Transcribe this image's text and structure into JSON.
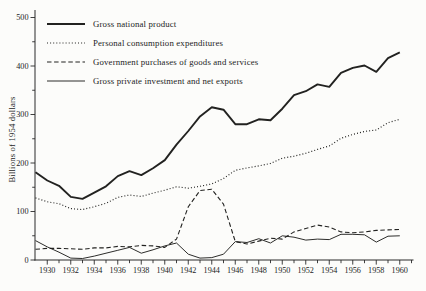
{
  "figure": {
    "background": "#fcfcfa",
    "ink": "#222220"
  },
  "chart_data": {
    "type": "line",
    "title": "",
    "xlabel": "",
    "ylabel": "Billions of 1954 dollars",
    "x": [
      1929,
      1930,
      1931,
      1932,
      1933,
      1934,
      1935,
      1936,
      1937,
      1938,
      1939,
      1940,
      1941,
      1942,
      1943,
      1944,
      1945,
      1946,
      1947,
      1948,
      1949,
      1950,
      1951,
      1952,
      1953,
      1954,
      1955,
      1956,
      1957,
      1958,
      1959,
      1960
    ],
    "x_tick_labels": [
      "1930",
      "1932",
      "1934",
      "1936",
      "1938",
      "1940",
      "1942",
      "1944",
      "1946",
      "1948",
      "1950",
      "1952",
      "1954",
      "1956",
      "1958",
      "1960"
    ],
    "x_major_ticks": [
      1930,
      1932,
      1934,
      1936,
      1938,
      1940,
      1942,
      1944,
      1946,
      1948,
      1950,
      1952,
      1954,
      1956,
      1958,
      1960
    ],
    "x_minor_ticks": [
      1931,
      1933,
      1935,
      1937,
      1939,
      1941,
      1943,
      1945,
      1947,
      1949,
      1951,
      1953,
      1955,
      1957,
      1959,
      1961
    ],
    "ylim": [
      0,
      500
    ],
    "y_major_ticks": [
      0,
      100,
      200,
      300,
      400,
      500
    ],
    "y_major_tick_labels": [
      "0",
      "100",
      "200",
      "300",
      "400",
      "500"
    ],
    "y_minor_ticks": [
      50,
      150,
      250,
      350,
      450
    ],
    "grid": false,
    "legend_position": "upper-left-inside",
    "series": [
      {
        "name": "Gross national product",
        "line": "solid-thick",
        "values": [
          181,
          164,
          153,
          130,
          126,
          139,
          152,
          173,
          183,
          175,
          189,
          206,
          238,
          266,
          296,
          315,
          310,
          280,
          280,
          290,
          288,
          312,
          340,
          348,
          362,
          357,
          386,
          396,
          401,
          388,
          416,
          428
        ]
      },
      {
        "name": "Personal consumption expenditures",
        "line": "dotted",
        "values": [
          128,
          120,
          116,
          106,
          104,
          110,
          117,
          129,
          134,
          131,
          138,
          144,
          151,
          148,
          152,
          157,
          168,
          185,
          190,
          194,
          199,
          210,
          214,
          220,
          228,
          235,
          251,
          259,
          265,
          268,
          283,
          290
        ]
      },
      {
        "name": "Government purchases of goods and services",
        "line": "dashed",
        "values": [
          22,
          24,
          24,
          23,
          22,
          25,
          25,
          28,
          27,
          30,
          29,
          26,
          43,
          110,
          143,
          146,
          115,
          38,
          33,
          39,
          45,
          43,
          58,
          65,
          72,
          68,
          58,
          56,
          58,
          61,
          62,
          63
        ]
      },
      {
        "name": "Gross private investment and net exports",
        "line": "solid-thin",
        "values": [
          40,
          27,
          16,
          4,
          3,
          8,
          14,
          20,
          26,
          14,
          21,
          29,
          35,
          12,
          4,
          5,
          12,
          38,
          36,
          44,
          35,
          50,
          47,
          41,
          43,
          42,
          53,
          53,
          52,
          37,
          49,
          50
        ]
      }
    ]
  }
}
